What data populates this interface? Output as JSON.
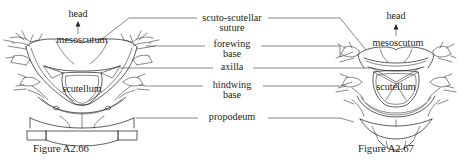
{
  "figure": {
    "kind": "anatomical-line-drawing",
    "background_color": "#ffffff",
    "ink_color": "#2b2724",
    "text_color": "#231f20"
  },
  "labels": {
    "head_left": "head",
    "head_right": "head",
    "mesoscutum_left": "mesoscutum",
    "mesoscutum_right": "mesoscutum",
    "scutellum_left": "scutellum",
    "scutellum_right": "scutellum",
    "suture_line1": "scuto-scutellar",
    "suture_line2": "suture",
    "forewing_line1": "forewing",
    "forewing_line2": "base",
    "axilla": "axilla",
    "hindwing_line1": "hindwing",
    "hindwing_line2": "base",
    "propodeum": "propodeum"
  },
  "captions": {
    "left": "Figure A2.66",
    "right": "Figure A2.67"
  },
  "center_callouts": [
    {
      "id": "scuto-scutellar-suture",
      "line1": "scuto-scutellar",
      "line2": "suture",
      "y": 20
    },
    {
      "id": "forewing-base",
      "line1": "forewing",
      "line2": "base",
      "y": 45
    },
    {
      "id": "axilla",
      "line1": "axilla",
      "line2": "",
      "y": 72
    },
    {
      "id": "hindwing-base",
      "line1": "hindwing",
      "line2": "base",
      "y": 86
    },
    {
      "id": "propodeum",
      "line1": "propodeum",
      "line2": "",
      "y": 118
    }
  ]
}
